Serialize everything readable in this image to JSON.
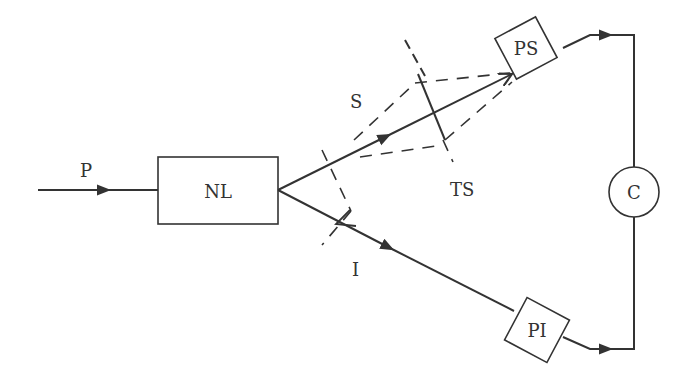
{
  "diagram": {
    "title": "",
    "type": "optical experiment schematic (parametric down-conversion coincidence setup)",
    "colors": {
      "stroke": "#333333",
      "background": "#ffffff"
    },
    "nodes": {
      "pump": {
        "label": "P"
      },
      "nonlinear_crystal": {
        "label": "NL"
      },
      "signal_beam": {
        "label": "S"
      },
      "idler_beam": {
        "label": "I"
      },
      "test_slit_signal": {
        "label": "TS"
      },
      "detector_signal": {
        "label": "PS"
      },
      "detector_idler": {
        "label": "PI"
      },
      "coincidence_counter": {
        "label": "C"
      }
    },
    "edges": [
      {
        "from": "P",
        "to": "NL",
        "style": "solid",
        "arrow": "forward"
      },
      {
        "from": "NL",
        "to": "PS",
        "style": "solid",
        "arrow": "forward",
        "beam": "S"
      },
      {
        "from": "PS",
        "to": "NL",
        "style": "solid",
        "arrow": "back-reflection",
        "beam": "S"
      },
      {
        "from": "NL",
        "to": "PI",
        "style": "solid",
        "arrow": "forward",
        "beam": "I"
      },
      {
        "from": "PS",
        "to": "C",
        "style": "solid",
        "arrow": "forward"
      },
      {
        "from": "PI",
        "to": "C",
        "style": "solid",
        "arrow": "forward"
      },
      {
        "from": "slit-near-NL",
        "to": "PS",
        "style": "dashed",
        "meaning": "ray envelope"
      },
      {
        "from": "TS",
        "to": "slit-near-NL",
        "style": "dashed",
        "meaning": "ray envelope"
      }
    ]
  }
}
